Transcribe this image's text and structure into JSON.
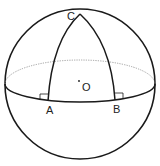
{
  "diagram": {
    "type": "spherical-triangle",
    "labels": {
      "C": "C",
      "O": "O",
      "A": "A",
      "B": "B"
    },
    "colors": {
      "stroke": "#1a1a1a",
      "dotted": "#888888",
      "background": "#ffffff"
    }
  }
}
